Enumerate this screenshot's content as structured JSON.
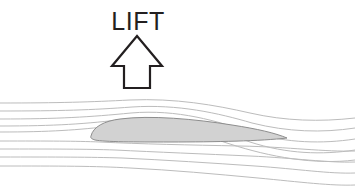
{
  "diagram": {
    "background_color": "#ffffff",
    "label": {
      "text": "LIFT",
      "color": "#231f20",
      "x": 138,
      "y": 30,
      "font_size": 25
    },
    "arrow": {
      "name": "lift-arrow",
      "direction": "up",
      "fill": "none",
      "stroke_color": "#231f20",
      "stroke_width": 2.2,
      "tip_x": 137,
      "tip_y": 36,
      "head_half_width": 25,
      "head_base_y": 66,
      "shaft_half_width": 13,
      "shaft_bottom_y": 88
    },
    "airfoil": {
      "name": "airfoil-body",
      "fill": "#d2d2d2",
      "stroke_color": "#8d8d8d",
      "stroke_width": 1,
      "leading_edge_x": 91,
      "leading_edge_y": 136,
      "trailing_edge_x": 287,
      "trailing_edge_y": 138,
      "max_thickness": 21,
      "chord_length": 196
    },
    "streamlines": {
      "name": "flow-streamlines",
      "color": "#bcbcbc",
      "stroke_width": 1,
      "count_upper": 5,
      "count_lower": 4,
      "inlet_x": 0,
      "outlet_x": 355,
      "description": "Air streamlines compress and accelerate over the upper surface, then deflect downward behind the trailing edge producing downwash.",
      "upper_inlet_y": [
        103,
        111,
        119,
        127,
        133
      ],
      "lower_inlet_y": [
        143,
        151,
        159,
        167
      ],
      "upper_outlet_y": [
        118,
        128,
        139,
        150,
        160
      ],
      "lower_outlet_y": [
        151,
        162,
        173,
        184
      ]
    }
  }
}
